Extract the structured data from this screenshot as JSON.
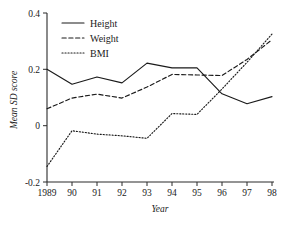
{
  "chart_data": {
    "type": "line",
    "title": "",
    "xlabel": "Year",
    "ylabel": "Mean SD score",
    "x": [
      1989,
      1990,
      1991,
      1992,
      1993,
      1994,
      1995,
      1996,
      1997,
      1998
    ],
    "xtick_labels": [
      "1989",
      "90",
      "91",
      "92",
      "93",
      "94",
      "95",
      "96",
      "97",
      "98"
    ],
    "ytick_labels": [
      "0.4",
      "0.2",
      "0",
      "-0.2"
    ],
    "ytick_values": [
      0.4,
      0.2,
      0,
      -0.2
    ],
    "xlim": [
      1989,
      1998
    ],
    "ylim": [
      -0.2,
      0.4
    ],
    "grid": false,
    "legend_position": "top-left",
    "series": [
      {
        "name": "Height",
        "style": "solid",
        "values": [
          0.2,
          0.147,
          0.173,
          0.152,
          0.222,
          0.205,
          0.205,
          0.113,
          0.078,
          0.103
        ]
      },
      {
        "name": "Weight",
        "style": "dashed",
        "values": [
          0.06,
          0.098,
          0.112,
          0.098,
          0.137,
          0.182,
          0.18,
          0.178,
          0.235,
          0.305
        ]
      },
      {
        "name": "BMI",
        "style": "dotted",
        "values": [
          -0.145,
          -0.018,
          -0.03,
          -0.036,
          -0.045,
          0.043,
          0.04,
          0.13,
          0.225,
          0.325
        ]
      }
    ]
  },
  "legend": {
    "items": [
      {
        "label": "Height"
      },
      {
        "label": "Weight"
      },
      {
        "label": "BMI"
      }
    ]
  },
  "axes": {
    "y_title": "Mean SD score",
    "x_title": "Year"
  }
}
